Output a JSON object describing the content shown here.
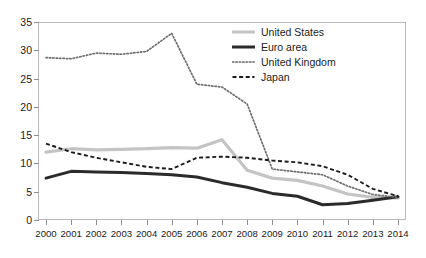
{
  "chart_data": {
    "type": "line",
    "title": "",
    "subtitle": "",
    "xlabel": "",
    "ylabel": "",
    "grid": false,
    "legend_position": "top-right",
    "categories": [
      "2000",
      "2001",
      "2002",
      "2003",
      "2004",
      "2005",
      "2006",
      "2007",
      "2008",
      "2009",
      "2010",
      "2011",
      "2012",
      "2013",
      "2014"
    ],
    "xlim": [
      2000,
      2014
    ],
    "ylim": [
      0,
      35
    ],
    "yticks": [
      0,
      5,
      10,
      15,
      20,
      25,
      30,
      35
    ],
    "series": [
      {
        "name": "United States",
        "style": "solid-light",
        "color": "#c4c4c4",
        "values": [
          12.0,
          12.6,
          12.4,
          12.5,
          12.6,
          12.8,
          12.7,
          14.2,
          8.8,
          7.4,
          7.0,
          6.0,
          4.6,
          4.0,
          3.9
        ]
      },
      {
        "name": "Euro area",
        "style": "solid-dark",
        "color": "#2b2b2b",
        "values": [
          7.4,
          8.6,
          8.5,
          8.4,
          8.2,
          8.0,
          7.6,
          6.6,
          5.8,
          4.7,
          4.2,
          2.7,
          2.9,
          3.5,
          4.1
        ]
      },
      {
        "name": "United Kingdom",
        "style": "dotted",
        "color": "#6e6e6e",
        "values": [
          28.7,
          28.5,
          29.5,
          29.3,
          29.8,
          33.0,
          24.0,
          23.5,
          20.5,
          9.0,
          8.5,
          8.0,
          6.0,
          4.5,
          4.0
        ]
      },
      {
        "name": "Japan",
        "style": "dashed",
        "color": "#1b1b1b",
        "values": [
          13.5,
          12.0,
          11.0,
          10.2,
          9.4,
          9.0,
          11.0,
          11.2,
          11.0,
          10.5,
          10.2,
          9.5,
          8.0,
          5.5,
          4.2
        ]
      }
    ]
  }
}
